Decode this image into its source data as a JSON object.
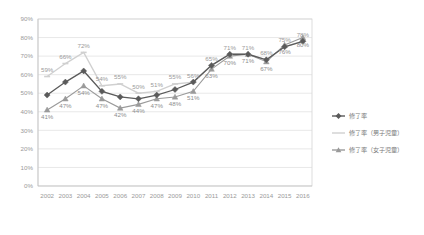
{
  "chart_data": {
    "type": "line",
    "title": "",
    "xlabel": "",
    "ylabel": "",
    "ylim": [
      0,
      90
    ],
    "ytick_step": 10,
    "grid": true,
    "legend_position": "right",
    "categories": [
      "2002",
      "2003",
      "2004",
      "2005",
      "2006",
      "2007",
      "2008",
      "2009",
      "2010",
      "2011",
      "2012",
      "2013",
      "2014",
      "2015",
      "2016"
    ],
    "ytick_labels": [
      "90%",
      "80%",
      "70%",
      "60%",
      "50%",
      "40%",
      "30%",
      "20%",
      "10%",
      "0%"
    ],
    "ytick_values": [
      90,
      80,
      70,
      60,
      50,
      40,
      30,
      20,
      10,
      0
    ],
    "series": [
      {
        "name": "修了率",
        "key": "overall",
        "marker": "diamond",
        "color": "#5a5a5a",
        "values": [
          49,
          56,
          62,
          51,
          48,
          47,
          49,
          52,
          56,
          65,
          71,
          71,
          68,
          75,
          78
        ],
        "labels": [
          "",
          "",
          "",
          "",
          "",
          "",
          "",
          "",
          "",
          "",
          "",
          "",
          "",
          "",
          ""
        ]
      },
      {
        "name": "修了率（男子児童）",
        "key": "male",
        "marker": "dash",
        "color": "#d0d0d0",
        "values": [
          59,
          66,
          72,
          54,
          55,
          50,
          51,
          55,
          56,
          65,
          71,
          71,
          68,
          75,
          78
        ],
        "labels": [
          "59%",
          "66%",
          "72%",
          "54%",
          "55%",
          "50%",
          "51%",
          "55%",
          "56%",
          "65%",
          "71%",
          "71%",
          "68%",
          "75%",
          "78%"
        ]
      },
      {
        "name": "修了率（女子児童）",
        "key": "female",
        "marker": "triangle",
        "color": "#9a9a9a",
        "values": [
          41,
          47,
          54,
          47,
          42,
          44,
          47,
          48,
          51,
          63,
          70,
          71,
          67,
          76,
          80
        ],
        "labels": [
          "41%",
          "47%",
          "54%",
          "47%",
          "42%",
          "44%",
          "47%",
          "48%",
          "51%",
          "63%",
          "70%",
          "71%",
          "67%",
          "76%",
          "80%"
        ]
      }
    ]
  },
  "legend": {
    "items": [
      {
        "label": "修了率"
      },
      {
        "label": "修了率（男子児童）"
      },
      {
        "label": "修了率（女子児童）"
      }
    ]
  }
}
